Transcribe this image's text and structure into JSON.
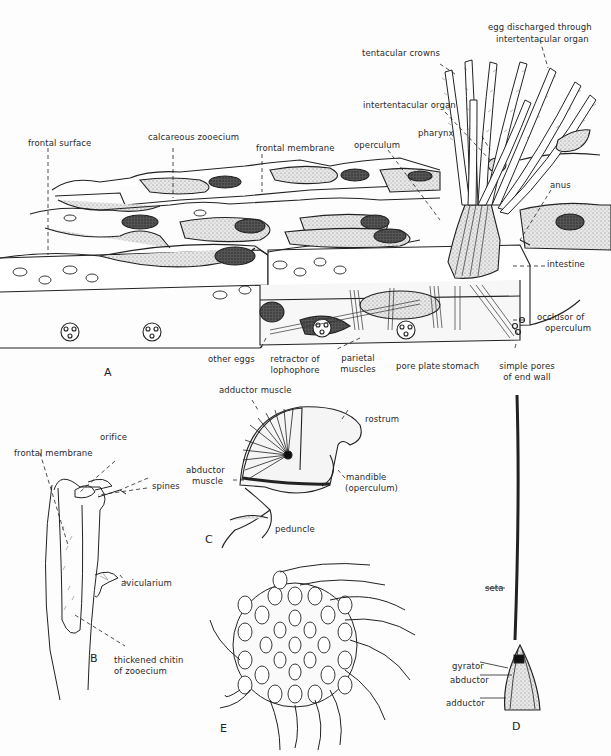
{
  "figure": {
    "panels": [
      {
        "id": "A",
        "letter": "A",
        "labels": {
          "frontal_surface": "frontal surface",
          "calcareous_zooecium": "calcareous zooecium",
          "frontal_membrane": "frontal membrane",
          "operculum": "operculum",
          "tentacular_crowns": "tentacular crowns",
          "egg_discharged_1": "egg discharged through",
          "egg_discharged_2": "intertentacular organ",
          "intertentacular_organ": "intertentacular organ",
          "pharynx": "pharynx",
          "anus": "anus",
          "intestine": "intestine",
          "occlusor_1": "occlusor of",
          "occlusor_2": "operculum",
          "other_eggs": "other eggs",
          "retractor_1": "retractor of",
          "retractor_2": "lophophore",
          "parietal_1": "parietal",
          "parietal_2": "muscles",
          "pore_plate": "pore plate",
          "stomach": "stomach",
          "simple_pores_1": "simple pores",
          "simple_pores_2": "of end wall"
        }
      },
      {
        "id": "B",
        "letter": "B",
        "labels": {
          "frontal_membrane": "frontal membrane",
          "orifice": "orifice",
          "spines": "spines",
          "avicularium": "avicularium",
          "thickened_1": "thickened chitin",
          "thickened_2": "of zooecium"
        }
      },
      {
        "id": "C",
        "letter": "C",
        "labels": {
          "adductor_muscle": "adductor muscle",
          "abductor_1": "abductor",
          "abductor_2": "muscle",
          "rostrum": "rostrum",
          "mandible_1": "mandible",
          "mandible_2": "(operculum)",
          "peduncle": "peduncle"
        }
      },
      {
        "id": "D",
        "letter": "D",
        "labels": {
          "seta": "seta",
          "gyrator": "gyrator",
          "abductor": "abductor",
          "adductor": "adductor"
        }
      },
      {
        "id": "E",
        "letter": "E",
        "labels": {}
      }
    ]
  }
}
